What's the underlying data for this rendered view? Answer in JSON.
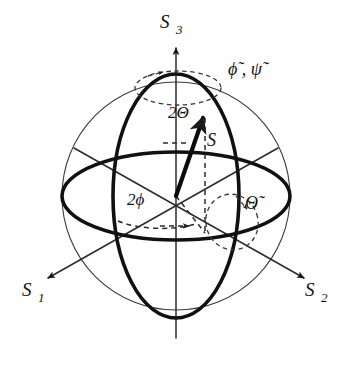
{
  "figure": {
    "name": "poincare-sphere",
    "background_color": "#ffffff",
    "line_color": "#111111",
    "outline_color": "#3a3a3a"
  },
  "axes": [
    {
      "id": "s1",
      "label_base": "S",
      "label_sub": "1",
      "position": "lower-left",
      "label_x": 22,
      "label_y": 296,
      "sub_x": 38,
      "sub_y": 302
    },
    {
      "id": "s2",
      "label_base": "S",
      "label_sub": "2",
      "position": "lower-right",
      "label_x": 305,
      "label_y": 296,
      "sub_x": 321,
      "sub_y": 302
    },
    {
      "id": "s3",
      "label_base": "S",
      "label_sub": "3",
      "position": "top",
      "label_x": 160,
      "label_y": 28,
      "sub_x": 176,
      "sub_y": 34
    }
  ],
  "vector": {
    "id": "stokes-vector",
    "label": "S",
    "label_x": 207,
    "label_y": 146
  },
  "angles": [
    {
      "id": "two-theta",
      "label": "2Θ",
      "description": "polar angle 2 Theta between S3 axis and Stokes vector",
      "label_x": 168,
      "label_y": 118
    },
    {
      "id": "two-phi",
      "label": "2ϕ",
      "description": "azimuthal angle 2 phi in the equatorial plane",
      "label_x": 127,
      "label_y": 205
    }
  ],
  "rotations": [
    {
      "id": "phi-psi-tilde",
      "label": "ϕ̃ , ψ̃",
      "plain": "phi-tilde, psi-tilde",
      "description": "rotation about the S3 axis at the north pole",
      "label_x": 228,
      "label_y": 75
    },
    {
      "id": "theta-tilde",
      "label": "Θ̃",
      "plain": "Theta-tilde",
      "description": "rotation about the equatorial direction",
      "label_x": 245,
      "label_y": 209
    }
  ],
  "geometry": {
    "center_x": 176,
    "center_y": 196,
    "sphere_radius": 114,
    "equator_semi_minor": 44,
    "meridian_semi_minor": 63,
    "vector_tip_x": 203,
    "vector_tip_y": 113
  }
}
